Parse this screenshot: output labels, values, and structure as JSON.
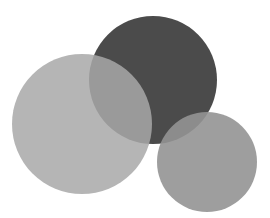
{
  "illustration": {
    "description": "Three overlapping gray circles",
    "background": "#ffffff",
    "circles": [
      {
        "name": "dark-circle",
        "cx": 153,
        "cy": 80,
        "r": 64,
        "color": "#4b4b4b",
        "opacity": 1
      },
      {
        "name": "large-light-circle",
        "cx": 82,
        "cy": 124,
        "r": 70,
        "color": "#a8a8a8",
        "opacity": 0.85
      },
      {
        "name": "small-right-circle",
        "cx": 207,
        "cy": 162,
        "r": 50,
        "color": "#939393",
        "opacity": 0.9
      }
    ]
  }
}
